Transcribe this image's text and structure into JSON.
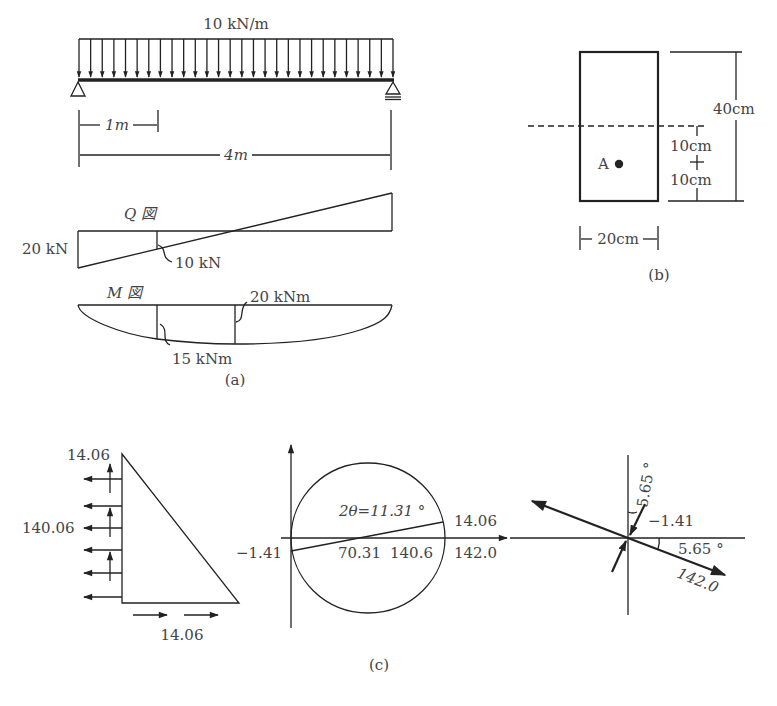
{
  "figure_a": {
    "load_label": "10 kN/m",
    "dim_1m": "1m",
    "dim_4m": "4m",
    "q_title": "Q 図",
    "q_left_value": "20 kN",
    "q_marker_value": "10 kN",
    "m_title": "M 図",
    "m_mid_value": "20 kNm",
    "m_marker_value": "15 kNm",
    "caption": "(a)"
  },
  "figure_b": {
    "height_label": "40cm",
    "upper_offset_label": "10cm",
    "lower_offset_label": "10cm",
    "width_label": "20cm",
    "point_label": "A",
    "caption": "(b)"
  },
  "figure_c": {
    "stress_block": {
      "top_value": "14.06",
      "side_value": "140.06",
      "bottom_value": "14.06"
    },
    "mohr_circle": {
      "angle_label": "2θ=11.31 °",
      "shear_value": "14.06",
      "left_value": "−1.41",
      "center_value": "70.31",
      "sigma_value": "140.6",
      "max_value": "142.0"
    },
    "principal": {
      "angle_vertical": "5.65 °",
      "angle_horizontal": "5.65 °",
      "min_value": "−1.41",
      "max_value": "142.0"
    },
    "caption": "(c)"
  },
  "colors": {
    "line": "#222222",
    "text": "#444444",
    "background": "#ffffff"
  }
}
